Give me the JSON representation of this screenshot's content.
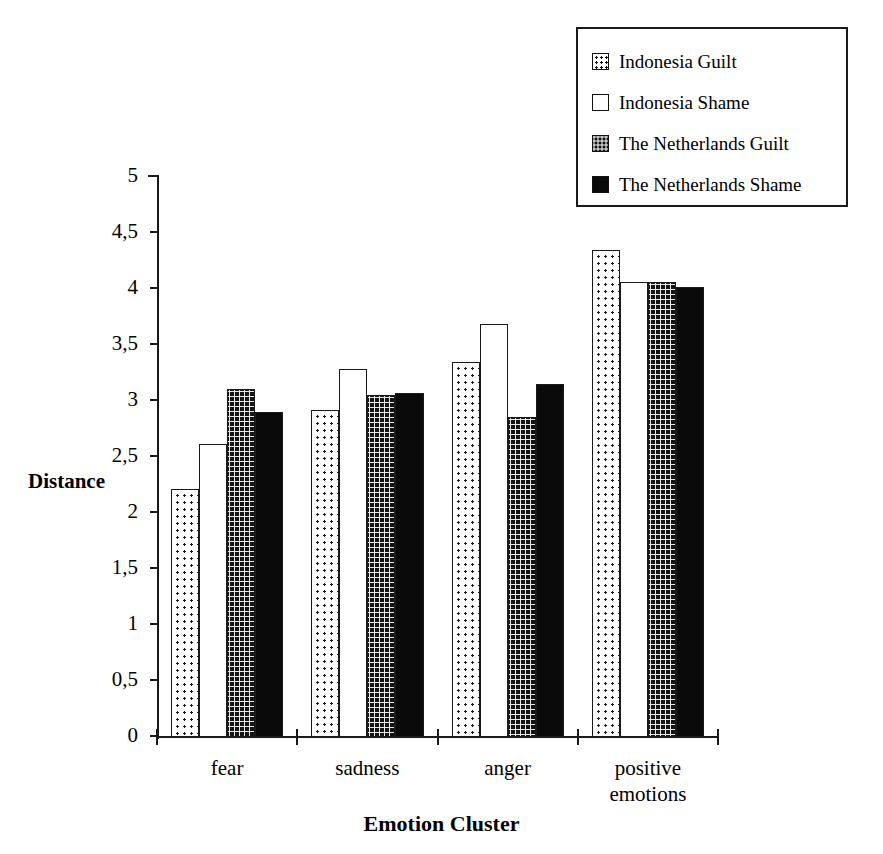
{
  "chart_data": {
    "type": "bar",
    "title": "",
    "xlabel": "Emotion Cluster",
    "ylabel": "Distance",
    "categories": [
      "fear",
      "sadness",
      "anger",
      "positive emotions"
    ],
    "category_lines": [
      [
        "fear"
      ],
      [
        "sadness"
      ],
      [
        "anger"
      ],
      [
        "positive",
        "emotions"
      ]
    ],
    "ylim": [
      0,
      5
    ],
    "ytick_values": [
      0,
      0.5,
      1,
      1.5,
      2,
      2.5,
      3,
      3.5,
      4,
      4.5,
      5
    ],
    "ytick_labels": [
      "0",
      "0,5",
      "1",
      "1,5",
      "2",
      "2,5",
      "3",
      "3,5",
      "4",
      "4,5",
      "5"
    ],
    "grid": false,
    "legend_position": "top-right",
    "series": [
      {
        "name": "Indonesia Guilt",
        "pattern": "sparse-dots",
        "values": [
          2.21,
          2.92,
          3.35,
          4.35
        ]
      },
      {
        "name": "Indonesia Shame",
        "pattern": "empty-white",
        "values": [
          2.62,
          3.29,
          3.69,
          4.06
        ]
      },
      {
        "name": "The Netherlands Guilt",
        "pattern": "dense-grid",
        "values": [
          3.11,
          3.05,
          2.86,
          4.06
        ]
      },
      {
        "name": "The Netherlands Shame",
        "pattern": "solid-black",
        "values": [
          2.9,
          3.07,
          3.15,
          4.02
        ]
      }
    ]
  },
  "legend": {
    "items": [
      {
        "label": "Indonesia Guilt",
        "swatch": "sparse-dots"
      },
      {
        "label": "Indonesia Shame",
        "swatch": "empty-white"
      },
      {
        "label": "The Netherlands Guilt",
        "swatch": "dense-grid"
      },
      {
        "label": "The Netherlands Shame",
        "swatch": "solid-black"
      }
    ]
  },
  "colors": {
    "axis": "#1a1a1a",
    "ink": "#000000",
    "background": "#ffffff",
    "solid_fill": "#0a0a0a"
  }
}
